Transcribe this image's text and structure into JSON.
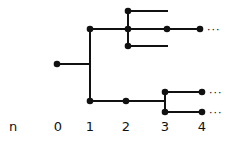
{
  "diagram": {
    "type": "branching-tree",
    "color": "#111111",
    "axis": {
      "variable_label": "n",
      "ticks": [
        {
          "label": "0",
          "x": 58
        },
        {
          "label": "1",
          "x": 90
        },
        {
          "label": "2",
          "x": 126
        },
        {
          "label": "3",
          "x": 165
        },
        {
          "label": "4",
          "x": 202
        }
      ],
      "label_y": 131,
      "variable_x": 13
    },
    "nodes": [
      {
        "id": "root",
        "x": 57,
        "y": 64,
        "gen": 0
      },
      {
        "id": "a",
        "x": 90,
        "y": 29,
        "gen": 1
      },
      {
        "id": "b",
        "x": 90,
        "y": 101,
        "gen": 1
      },
      {
        "id": "a1",
        "x": 128,
        "y": 11,
        "gen": 2
      },
      {
        "id": "a2",
        "x": 128,
        "y": 29,
        "gen": 2
      },
      {
        "id": "a3",
        "x": 128,
        "y": 46,
        "gen": 2
      },
      {
        "id": "a2x",
        "x": 167,
        "y": 29,
        "gen": 3
      },
      {
        "id": "a2y",
        "x": 200,
        "y": 29,
        "gen": 4
      },
      {
        "id": "b1",
        "x": 126,
        "y": 101,
        "gen": 2
      },
      {
        "id": "b11",
        "x": 165,
        "y": 92,
        "gen": 3
      },
      {
        "id": "b12",
        "x": 165,
        "y": 112,
        "gen": 3
      },
      {
        "id": "b11x",
        "x": 202,
        "y": 92,
        "gen": 4
      },
      {
        "id": "b12x",
        "x": 202,
        "y": 112,
        "gen": 4
      }
    ],
    "edges": [
      {
        "d": "M57 64 H90"
      },
      {
        "d": "M90 29 V101"
      },
      {
        "d": "M90 29 H128"
      },
      {
        "d": "M128 11 V46"
      },
      {
        "d": "M128 11 H168"
      },
      {
        "d": "M128 29 H200"
      },
      {
        "d": "M128 46 H168"
      },
      {
        "d": "M90 101 H165"
      },
      {
        "d": "M165 92 V112"
      },
      {
        "d": "M165 92 H202"
      },
      {
        "d": "M165 112 H202"
      }
    ],
    "continuations": [
      {
        "text": "···",
        "x": 207,
        "y": 33
      },
      {
        "text": "···",
        "x": 209,
        "y": 96
      },
      {
        "text": "···",
        "x": 209,
        "y": 116
      }
    ]
  }
}
